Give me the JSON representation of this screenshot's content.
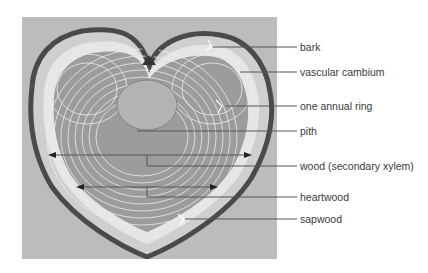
{
  "figure": {
    "labels": [
      {
        "id": "bark",
        "text": "bark",
        "y": 47
      },
      {
        "id": "vascular-cambium",
        "text": "vascular cambium",
        "y": 72
      },
      {
        "id": "annual-ring",
        "text": "one annual ring",
        "y": 106
      },
      {
        "id": "pith",
        "text": "pith",
        "y": 131
      },
      {
        "id": "wood",
        "text": "wood (secondary xylem)",
        "y": 166
      },
      {
        "id": "heartwood",
        "text": "heartwood",
        "y": 197
      },
      {
        "id": "sapwood",
        "text": "sapwood",
        "y": 219
      }
    ],
    "colors": {
      "background": "#ffffff",
      "photo_bg": "#bcbcbc",
      "bark": "#4a4a4a",
      "sapwood": "#e2e2e2",
      "heartwood": "#9a9a9a",
      "rings": "#efefef",
      "pith": "#b0b0b0",
      "leader": "#555555",
      "text": "#3a3a3a"
    }
  }
}
